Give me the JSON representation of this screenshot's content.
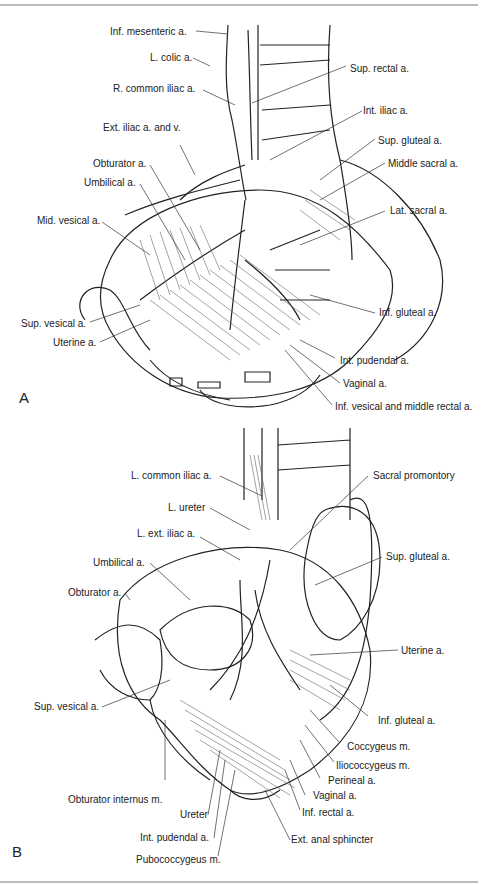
{
  "figure": {
    "panels": [
      {
        "letter": "A",
        "labels": [
          "Inf. mesenteric a.",
          "L. colic a.",
          "R. common iliac a.",
          "Sup. rectal a.",
          "Int. iliac a.",
          "Ext. iliac a. and v.",
          "Sup. gluteal a.",
          "Obturator a.",
          "Middle sacral a.",
          "Umbilical a.",
          "Mid. vesical a.",
          "Lat. sacral a.",
          "Inf. gluteal a.",
          "Sup. vesical a.",
          "Uterine a.",
          "Int. pudendal a.",
          "Vaginal a.",
          "Inf. vesical and middle rectal a."
        ]
      },
      {
        "letter": "B",
        "labels": [
          "L. common iliac a.",
          "Sacral promontory",
          "L. ureter",
          "L. ext. iliac a.",
          "Sup. gluteal a.",
          "Umbilical a.",
          "Obturator a.",
          "Uterine a.",
          "Sup. vesical a.",
          "Inf. gluteal a.",
          "Coccygeus m.",
          "Iliococcygeus m.",
          "Perineal a.",
          "Obturator internus m.",
          "Vaginal a.",
          "Inf. rectal a.",
          "Ureter",
          "Int. pudendal a.",
          "Ext. anal sphincter",
          "Pubococcygeus m."
        ]
      }
    ]
  }
}
